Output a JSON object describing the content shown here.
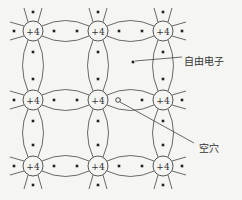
{
  "diagram": {
    "atom_charge": "+4",
    "atoms_x": [
      33,
      98,
      163
    ],
    "atoms_y": [
      31,
      100,
      166
    ],
    "labels": {
      "free_electron": "自由电子",
      "hole": "空穴"
    },
    "free_electron_pos": [
      133,
      62
    ],
    "hole_pos": [
      118,
      97
    ],
    "colors": {
      "line": "#444444",
      "background": "#f5f5f3"
    }
  }
}
